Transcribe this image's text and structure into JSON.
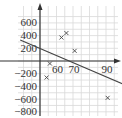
{
  "chart_data": {
    "type": "scatter",
    "title": "",
    "xlabel": "",
    "ylabel": "",
    "x_ticks": [
      60,
      70,
      90
    ],
    "y_ticks": [
      600,
      400,
      200,
      -200,
      -400,
      -600,
      -800
    ],
    "x_tick_labels": [
      "60",
      "70",
      "90"
    ],
    "y_tick_labels": [
      "600",
      "400",
      "200",
      "−200",
      "−400",
      "−600",
      "−800"
    ],
    "xlim": [
      38,
      100
    ],
    "ylim": [
      -820,
      720
    ],
    "y_axis_at_x": 50,
    "grid": true,
    "legend": null,
    "series": [
      {
        "name": "points",
        "marker": "x",
        "points": [
          {
            "x": 56,
            "y": -40
          },
          {
            "x": 54,
            "y": -260
          },
          {
            "x": 63,
            "y": 370
          },
          {
            "x": 66,
            "y": 440
          },
          {
            "x": 71,
            "y": 160
          },
          {
            "x": 91,
            "y": -580
          }
        ]
      },
      {
        "name": "line of best fit",
        "type": "line",
        "points": [
          {
            "x": 38,
            "y": 330
          },
          {
            "x": 50,
            "y": 230
          },
          {
            "x": 69.5,
            "y": 0
          },
          {
            "x": 100,
            "y": -360
          }
        ]
      }
    ]
  },
  "colors": {
    "grid": "#d9d9d9",
    "axis": "#333333",
    "marker": "#444444",
    "line": "#444444"
  }
}
